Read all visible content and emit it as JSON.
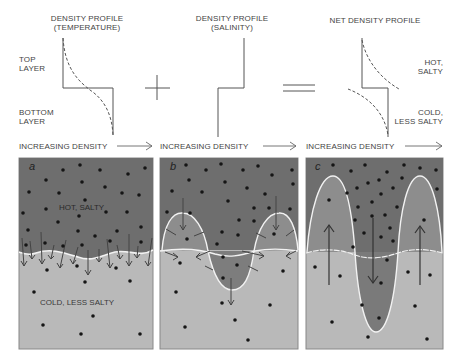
{
  "profiles": {
    "temperature": {
      "title_line1": "DENSITY PROFILE",
      "title_line2": "(TEMPERATURE)"
    },
    "salinity": {
      "title_line1": "DENSITY PROFILE",
      "title_line2": "(SALINITY)"
    },
    "net": {
      "title_line1": "NET DENSITY PROFILE"
    }
  },
  "layer_labels": {
    "top_line1": "TOP",
    "top_line2": "LAYER",
    "bottom_line1": "BOTTOM",
    "bottom_line2": "LAYER"
  },
  "net_labels": {
    "upper_line1": "HOT,",
    "upper_line2": "SALTY",
    "lower_line1": "COLD,",
    "lower_line2": "LESS SALTY"
  },
  "operators": {
    "plus": "+",
    "equals": "="
  },
  "axis_label": "INCREASING DENSITY",
  "panels": [
    {
      "id": "a",
      "label": "a",
      "top_text": "HOT, SALTY",
      "bottom_text": "COLD, LESS SALTY"
    },
    {
      "id": "b",
      "label": "b"
    },
    {
      "id": "c",
      "label": "c"
    }
  ],
  "colors": {
    "dark_water": "#6e6e6e",
    "light_water": "#b9b9b9",
    "finger_mid": "#8d8d8d",
    "interface": "#f2f2f2",
    "dot": "#151515",
    "line": "#555555"
  }
}
